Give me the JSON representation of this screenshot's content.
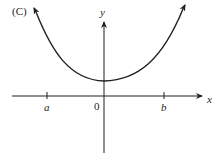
{
  "figure": {
    "panel_label": "(C)",
    "x_axis_label": "x",
    "y_axis_label": "y",
    "tick_labels": {
      "a": "a",
      "origin": "0",
      "b": "b"
    },
    "curve_description": "U-shaped curve opening upward with minimum above the origin on the y-axis, arrows at both ends",
    "colors": {
      "ink": "#231f20",
      "background": "#ffffff"
    }
  }
}
